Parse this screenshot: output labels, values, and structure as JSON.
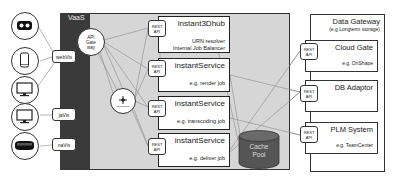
{
  "diagram": {
    "devices": [
      {
        "name": "vr-headset",
        "icon": "vr-headset-icon"
      },
      {
        "name": "smartphone",
        "icon": "smartphone-icon"
      },
      {
        "name": "desktop-monitor",
        "icon": "monitor-icon"
      },
      {
        "name": "desktop-monitor-2",
        "icon": "monitor-icon"
      },
      {
        "name": "ar-headset",
        "icon": "ar-headset-icon"
      }
    ],
    "clients": [
      {
        "label": "webVis"
      },
      {
        "label": "jaVis"
      },
      {
        "label": "naVis"
      }
    ],
    "vaas": {
      "label": "VaaS",
      "api_gateway": {
        "line1": "API",
        "line2": "Gate",
        "line3": "way"
      },
      "load_balancer": {
        "label": "Load Balancer",
        "icon": "load-balancer-icon"
      },
      "services": [
        {
          "title": "instant3Dhub",
          "sub1": "URN resolver",
          "sub2": "Internal Job Balancer",
          "api_line1": "REST",
          "api_line2": "API"
        },
        {
          "title": "instantService",
          "sub1": "e.g. render job",
          "api_line1": "REST",
          "api_line2": "API"
        },
        {
          "title": "instantService",
          "sub1": "e.g. transcoding job",
          "api_line1": "REST",
          "api_line2": "API"
        },
        {
          "title": "instantService",
          "sub1": "e.g. deliver job",
          "api_line1": "REST",
          "api_line2": "API"
        }
      ],
      "cache": {
        "line1": "Cache",
        "line2": "Pool"
      }
    },
    "data_gateway": {
      "title": "Data Gateway",
      "subtitle": "(e.g Longterm storage)",
      "sources": [
        {
          "title": "Cloud Gate",
          "sub": "e.g. OnShape",
          "api_line1": "REST",
          "api_line2": "API"
        },
        {
          "title": "DB Adaptor",
          "sub": "",
          "api_line1": "REST",
          "api_line2": "API"
        },
        {
          "title": "PLM System",
          "sub": "e.g. TeamCenter",
          "api_line1": "REST",
          "api_line2": "API"
        }
      ]
    },
    "colors": {
      "vaas_dark": "#3a3a3a",
      "vaas_area": "#d6d6d6",
      "cache": "#555555",
      "lines": "#8a8a8a"
    }
  }
}
